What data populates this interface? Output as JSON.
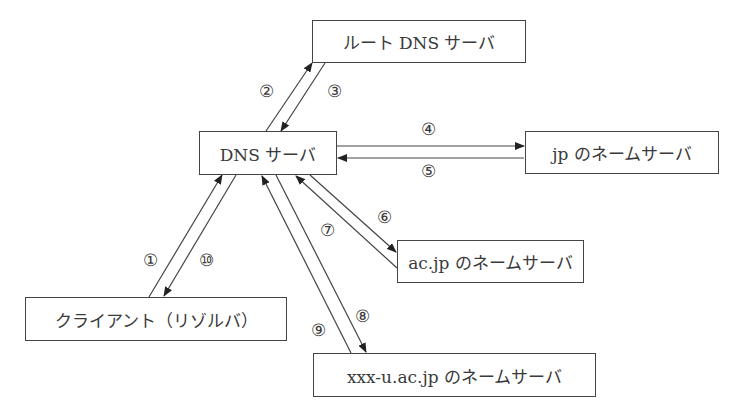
{
  "diagram": {
    "nodes": {
      "root": "ルート DNS サーバ",
      "dns": "DNS サーバ",
      "jp": "jp のネームサーバ",
      "acjp": "ac.jp のネームサーバ",
      "client": "クライアント（リゾルバ）",
      "xxx": "xxx-u.ac.jp のネームサーバ"
    },
    "steps": {
      "s1": "①",
      "s2": "②",
      "s3": "③",
      "s4": "④",
      "s5": "⑤",
      "s6": "⑥",
      "s7": "⑦",
      "s8": "⑧",
      "s9": "⑨",
      "s10": "⑩"
    },
    "edges": [
      {
        "step": "①",
        "from": "client",
        "to": "dns"
      },
      {
        "step": "②",
        "from": "dns",
        "to": "root"
      },
      {
        "step": "③",
        "from": "root",
        "to": "dns"
      },
      {
        "step": "④",
        "from": "dns",
        "to": "jp"
      },
      {
        "step": "⑤",
        "from": "jp",
        "to": "dns"
      },
      {
        "step": "⑥",
        "from": "dns",
        "to": "acjp"
      },
      {
        "step": "⑦",
        "from": "acjp",
        "to": "dns"
      },
      {
        "step": "⑧",
        "from": "dns",
        "to": "xxx"
      },
      {
        "step": "⑨",
        "from": "xxx",
        "to": "dns"
      },
      {
        "step": "⑩",
        "from": "dns",
        "to": "client"
      }
    ]
  }
}
